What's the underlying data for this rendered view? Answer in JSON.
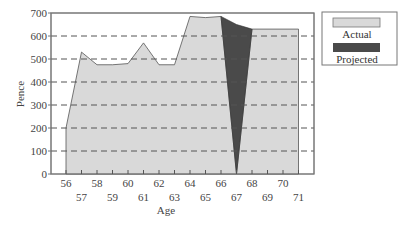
{
  "chart_data": {
    "type": "area",
    "title": "",
    "xlabel": "Age",
    "ylabel": "Pence",
    "ylim": [
      0,
      700
    ],
    "xlim": [
      56,
      71
    ],
    "yticks": [
      0,
      100,
      200,
      300,
      400,
      500,
      600,
      700
    ],
    "xticks": [
      56,
      57,
      58,
      59,
      60,
      61,
      62,
      63,
      64,
      65,
      66,
      67,
      68,
      69,
      70,
      71
    ],
    "grid": "horizontal dashed",
    "legend_position": "right",
    "series": [
      {
        "name": "Actual",
        "color": "#d9d9d9",
        "x": [
          56,
          56,
          57,
          58,
          59,
          60,
          61,
          62,
          63,
          64,
          65,
          66,
          67,
          68,
          71
        ],
        "values": [
          0,
          200,
          530,
          475,
          475,
          480,
          570,
          475,
          475,
          685,
          680,
          685,
          0,
          630,
          630
        ]
      },
      {
        "name": "Projected",
        "color": "#4a4a4a",
        "x": [
          66,
          67,
          68
        ],
        "values": [
          685,
          650,
          630
        ]
      }
    ]
  },
  "axes": {
    "xlabel": "Age",
    "ylabel": "Pence",
    "yticks": [
      "0",
      "100",
      "200",
      "300",
      "400",
      "500",
      "600",
      "700"
    ],
    "xticks_top": [
      "56",
      "58",
      "60",
      "62",
      "64",
      "66",
      "68",
      "70"
    ],
    "xticks_bottom": [
      "57",
      "59",
      "61",
      "63",
      "65",
      "67",
      "69",
      "71"
    ]
  },
  "legend": {
    "items": [
      {
        "label": "Actual",
        "color": "#d9d9d9"
      },
      {
        "label": "Projected",
        "color": "#4a4a4a"
      }
    ]
  }
}
